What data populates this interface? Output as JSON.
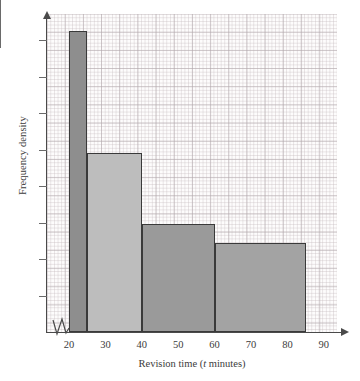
{
  "chart_data": {
    "type": "bar",
    "title": "",
    "subtitle": "",
    "xlabel": "Revision time (t minutes)",
    "xlabel_prefix": "Revision time (",
    "xlabel_variable": "t",
    "xlabel_suffix": " minutes)",
    "ylabel": "Frequency density",
    "xlim": [
      15,
      95
    ],
    "ylim": [
      0,
      9.6
    ],
    "xticks": [
      20,
      30,
      40,
      50,
      60,
      70,
      80,
      90
    ],
    "xtick_labels": [
      "20",
      "30",
      "40",
      "50",
      "60",
      "70",
      "80",
      "90"
    ],
    "ytick_labels": [],
    "ytick_count": 9,
    "grid": true,
    "grid_style": "graph-paper",
    "legend": "none",
    "axis_break_x": true,
    "bars": [
      {
        "label": "20-25",
        "x_start": 20,
        "x_end": 25,
        "width": 5,
        "frequency_density": 8.25,
        "color": "#8e8e8e"
      },
      {
        "label": "25-40",
        "x_start": 25,
        "x_end": 40,
        "width": 15,
        "frequency_density": 4.9,
        "color": "#bdbdbd"
      },
      {
        "label": "40-60",
        "x_start": 40,
        "x_end": 60,
        "width": 20,
        "frequency_density": 2.95,
        "color": "#9a9a9a"
      },
      {
        "label": "60-85",
        "x_start": 60,
        "x_end": 85,
        "width": 25,
        "frequency_density": 2.45,
        "color": "#a3a3a3"
      }
    ],
    "bar_border_color": "#3a3a3a",
    "background_color": "#fdfcfc",
    "grid_color": "#c6bcc0"
  }
}
